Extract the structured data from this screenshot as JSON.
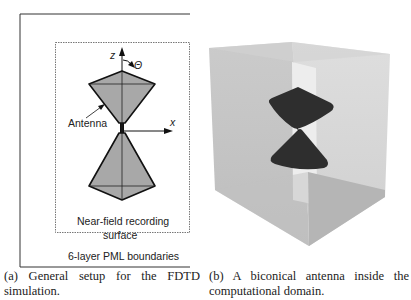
{
  "panel_a": {
    "labels": {
      "z_axis": "z",
      "theta": "Θ",
      "x_axis": "x",
      "antenna": "Antenna",
      "near_field_line1": "Near-field recording",
      "near_field_line2": "surface",
      "pml": "6-layer PML boundaries"
    },
    "caption": "(a) General setup for the FDTD simulation."
  },
  "panel_b": {
    "caption": "(b) A biconical antenna inside the computational domain."
  },
  "colors": {
    "cone_fill": "#a8a8a8",
    "cone_stroke": "#111111",
    "box_face_left": "#c4c4c4",
    "box_face_right": "#d6d6d6",
    "box_top": "#cfcfcf",
    "box_bottom": "#b4b4b4",
    "inner_slab": "#ececec",
    "cone_3d": "#2e2e2e"
  }
}
